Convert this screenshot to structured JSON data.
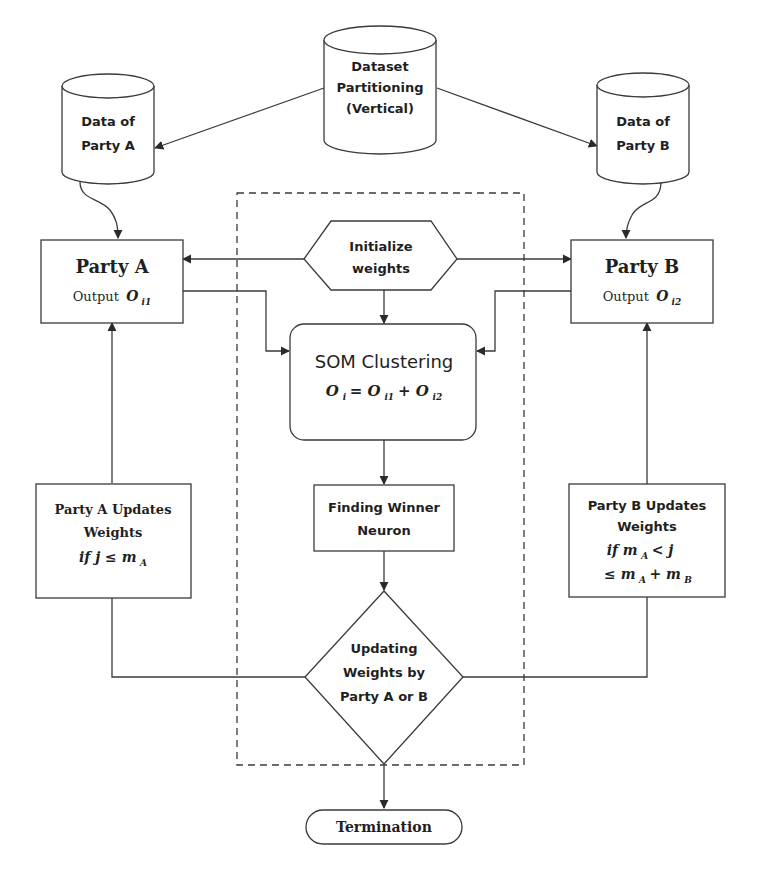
{
  "diagram": {
    "dataset": {
      "line1": "Dataset",
      "line2": "Partitioning",
      "line3": "(Vertical)"
    },
    "data_a": {
      "line1": "Data of",
      "line2": "Party A"
    },
    "data_b": {
      "line1": "Data of",
      "line2": "Party B"
    },
    "party_a": {
      "title": "Party A",
      "output_label": "Output",
      "output_var": "O",
      "output_sub": "i1"
    },
    "party_b": {
      "title": "Party B",
      "output_label": "Output",
      "output_var": "O",
      "output_sub": "i2"
    },
    "initialize": {
      "line1": "Initialize",
      "line2": "weights"
    },
    "som": {
      "title": "SOM Clustering",
      "formula": "O",
      "formula_sub": "i",
      "formula_eq": " = O",
      "formula_sub1": "i1",
      "formula_plus": " + O",
      "formula_sub2": "i2"
    },
    "winner": {
      "line1": "Finding Winner",
      "line2": "Neuron"
    },
    "update_a": {
      "line1": "Party A Updates",
      "line2": "Weights",
      "line3": "if j ≤ m",
      "line3_sub": "A"
    },
    "update_b": {
      "line1": "Party B Updates",
      "line2": "Weights",
      "line3a": "if m",
      "line3a_sub": "A",
      "line3b": " < j",
      "line4a": "≤ m",
      "line4a_sub": "A",
      "line4b": " + m",
      "line4b_sub": "B"
    },
    "decision": {
      "line1": "Updating",
      "line2": "Weights by",
      "line3": "Party A or B"
    },
    "termination": {
      "label": "Termination"
    }
  }
}
